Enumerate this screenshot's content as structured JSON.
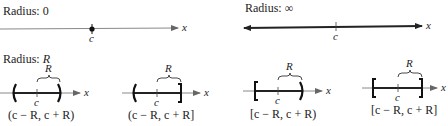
{
  "diagrams": {
    "radius_zero": {
      "title": "Radius: 0",
      "center_label": "c",
      "axis_label": "x"
    },
    "radius_infinity": {
      "title": "Radius: ∞",
      "center_label": "c",
      "axis_label": "x"
    },
    "radius_r": {
      "title_prefix": "Radius: ",
      "title_var": "R",
      "panels": [
        {
          "interval": "(c − R, c + R)",
          "left": "(",
          "right": ")",
          "center_label": "c",
          "brace_label": "R",
          "axis_label": "x"
        },
        {
          "interval": "(c − R, c + R]",
          "left": "(",
          "right": "]",
          "center_label": "c",
          "brace_label": "R",
          "axis_label": "x"
        },
        {
          "interval": "[c − R, c + R)",
          "left": "[",
          "right": ")",
          "center_label": "c",
          "brace_label": "R",
          "axis_label": "x"
        },
        {
          "interval": "[c − R, c + R]",
          "left": "[",
          "right": "]",
          "center_label": "c",
          "brace_label": "R",
          "axis_label": "x"
        }
      ]
    }
  },
  "colors": {
    "ink": "#222222",
    "thin_line": "#888888",
    "background": "#ffffff"
  }
}
